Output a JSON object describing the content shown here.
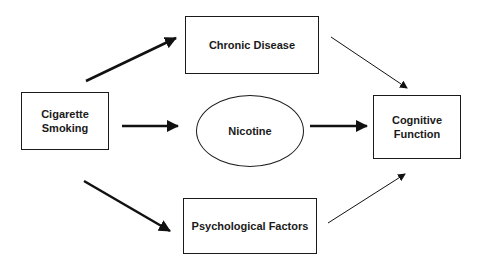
{
  "diagram": {
    "nodes": {
      "cigarette_smoking": {
        "label_line1": "Cigarette",
        "label_line2": "Smoking"
      },
      "chronic_disease": {
        "label": "Chronic Disease"
      },
      "nicotine": {
        "label": "Nicotine"
      },
      "psychological_factors": {
        "label": "Psychological Factors"
      },
      "cognitive_function": {
        "label_line1": "Cognitive",
        "label_line2": "Function"
      }
    },
    "edges": [
      {
        "from": "Cigarette Smoking",
        "to": "Chronic Disease"
      },
      {
        "from": "Cigarette Smoking",
        "to": "Nicotine"
      },
      {
        "from": "Cigarette Smoking",
        "to": "Psychological Factors"
      },
      {
        "from": "Chronic Disease",
        "to": "Cognitive Function"
      },
      {
        "from": "Nicotine",
        "to": "Cognitive Function"
      },
      {
        "from": "Psychological Factors",
        "to": "Cognitive Function"
      }
    ]
  }
}
